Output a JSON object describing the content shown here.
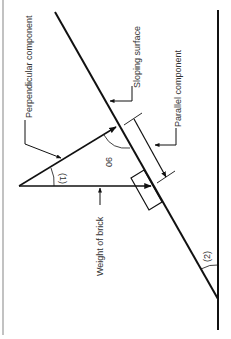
{
  "diagram": {
    "labels": {
      "perpendicular": "Perpendicular component",
      "sloping": "Sloping surface",
      "parallel": "Parallel component",
      "weight": "Weight of brick",
      "angle1": "(1)",
      "angle2": "(2)",
      "right_angle": "90"
    },
    "colors": {
      "line": "#111111",
      "text": "#333333",
      "border": "#999999"
    }
  }
}
